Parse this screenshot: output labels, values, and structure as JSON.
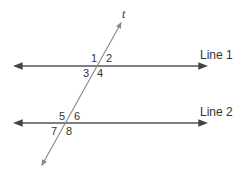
{
  "diagram": {
    "type": "parallel-lines-cut-by-transversal",
    "transversal": {
      "label": "t"
    },
    "lines": [
      {
        "label": "Line 1"
      },
      {
        "label": "Line 2"
      }
    ],
    "angles": {
      "a1": "1",
      "a2": "2",
      "a3": "3",
      "a4": "4",
      "a5": "5",
      "a6": "6",
      "a7": "7",
      "a8": "8"
    },
    "colors": {
      "line": "#555555",
      "transversal": "#888888",
      "text": "#333333"
    }
  }
}
